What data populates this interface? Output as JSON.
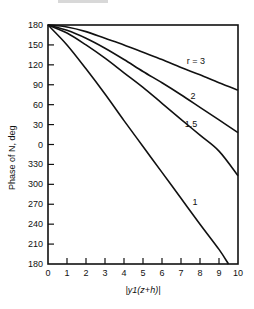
{
  "chart_data": {
    "type": "line",
    "title": "",
    "xlabel": "|y1(z+h)|",
    "ylabel": "Phase of N, deg",
    "x_ticks": [
      "0",
      "1",
      "2",
      "3",
      "4",
      "5",
      "6",
      "7",
      "8",
      "9",
      "10"
    ],
    "y_ticks": [
      "180",
      "150",
      "120",
      "90",
      "60",
      "30",
      "0",
      "330",
      "300",
      "270",
      "240",
      "210",
      "180"
    ],
    "xlim": [
      0,
      10
    ],
    "ylim_unwrapped": [
      -180,
      180
    ],
    "grid": false,
    "legend_position": "inline labels near right end of curves",
    "series": [
      {
        "name": "r = 3",
        "label": "r = 3",
        "x": [
          0,
          1,
          2,
          3,
          4,
          5,
          6,
          7,
          8,
          9,
          10
        ],
        "phase_unwrapped": [
          180,
          177,
          170,
          160,
          150,
          139,
          128,
          116,
          105,
          93,
          82
        ]
      },
      {
        "name": "r = 2",
        "label": "2",
        "x": [
          0,
          1,
          2,
          3,
          4,
          5,
          6,
          7,
          8,
          9,
          10
        ],
        "phase_unwrapped": [
          180,
          172,
          160,
          145,
          128,
          110,
          93,
          75,
          56,
          37,
          18
        ]
      },
      {
        "name": "r = 1.5",
        "label": "1.5",
        "x": [
          0,
          1,
          2,
          3,
          4,
          5,
          6,
          7,
          8,
          9,
          10
        ],
        "phase_unwrapped": [
          180,
          168,
          150,
          130,
          108,
          86,
          62,
          38,
          14,
          -10,
          -47
        ]
      },
      {
        "name": "r = 1",
        "label": "1",
        "x": [
          0,
          1,
          2,
          3,
          4,
          5,
          6,
          7,
          8,
          9,
          9.5
        ],
        "phase_unwrapped": [
          180,
          150,
          114,
          76,
          36,
          -3,
          -42,
          -81,
          -120,
          -158,
          -180
        ]
      }
    ]
  }
}
